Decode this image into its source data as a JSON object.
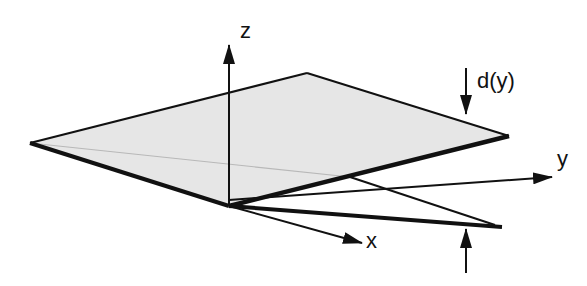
{
  "diagram": {
    "type": "3d-plate-deflection",
    "axes": {
      "z_label": "z",
      "y_label": "y",
      "x_label": "x"
    },
    "annotation": {
      "deflection_label": "d(y)"
    },
    "colors": {
      "plate_fill": "#e6e6e6",
      "line": "#111111",
      "hidden_edge": "#b8b8b8"
    }
  }
}
